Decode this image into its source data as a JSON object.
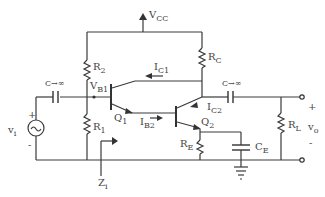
{
  "diagram": {
    "labels": {
      "vcc": {
        "main": "V",
        "sub": "CC"
      },
      "r2": {
        "main": "R",
        "sub": "2"
      },
      "r1": {
        "main": "R",
        "sub": "1"
      },
      "rc": {
        "main": "R",
        "sub": "C"
      },
      "re": {
        "main": "R",
        "sub": "E"
      },
      "rl": {
        "main": "R",
        "sub": "L"
      },
      "ce": {
        "main": "C",
        "sub": "E"
      },
      "cin": "C→∞",
      "cout": "C→∞",
      "vb1": {
        "main": "V",
        "sub": "B1"
      },
      "ic1": {
        "main": "I",
        "sub": "C1"
      },
      "ic2": {
        "main": "I",
        "sub": "C2"
      },
      "ib2": {
        "main": "I",
        "sub": "B2"
      },
      "q1": {
        "main": "Q",
        "sub": "1"
      },
      "q2": {
        "main": "Q",
        "sub": "2"
      },
      "vi": {
        "main": "v",
        "sub": "i"
      },
      "vo": {
        "main": "v",
        "sub": "o"
      },
      "zi": {
        "main": "Z",
        "sub": "i"
      },
      "vi_plus": "+",
      "vi_minus": "-",
      "vo_plus": "+",
      "vo_minus": "-"
    },
    "components": [
      "R1",
      "R2",
      "RC",
      "RE",
      "RL",
      "CE",
      "C_in",
      "C_out",
      "Q1",
      "Q2",
      "vi source",
      "ground"
    ]
  }
}
